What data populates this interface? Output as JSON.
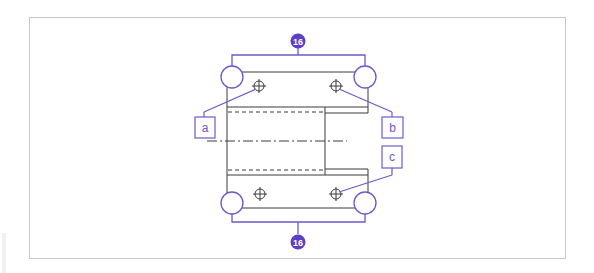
{
  "figure": {
    "type": "technical-drawing",
    "colors": {
      "frame": "#c8c8c8",
      "drawing_lines": "#3a3a3a",
      "callouts": "#6a5acd",
      "badge_fill": "#5b3fc4",
      "background": "#ffffff"
    }
  },
  "badges": {
    "top": "16",
    "bottom": "16"
  },
  "labels": {
    "a": "a",
    "b": "b",
    "c": "c"
  }
}
